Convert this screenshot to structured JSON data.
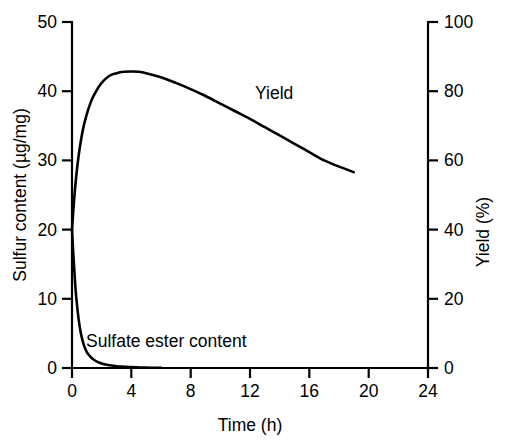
{
  "chart_data": {
    "type": "line",
    "title": "",
    "xlabel": "Time (h)",
    "ylabel": "Sulfur content (µg/mg)",
    "y2label": "Yield (%)",
    "xlim": [
      0,
      24
    ],
    "ylim": [
      0,
      50
    ],
    "y2lim": [
      0,
      100
    ],
    "xticks": [
      0,
      4,
      8,
      12,
      16,
      20,
      24
    ],
    "xticklabels": [
      "0",
      "4",
      "8",
      "12",
      "16",
      "20",
      "24"
    ],
    "yticks": [
      0,
      10,
      20,
      30,
      40,
      50
    ],
    "yticklabels": [
      "0",
      "10",
      "20",
      "30",
      "40",
      "50"
    ],
    "y2ticks": [
      0,
      20,
      40,
      60,
      80,
      100
    ],
    "y2ticklabels": [
      "0",
      "20",
      "40",
      "60",
      "80",
      "100"
    ],
    "grid": false,
    "legend": "inline-annotations",
    "series": [
      {
        "name": "Yield",
        "label": "Yield",
        "axis": "left",
        "color": "#000000",
        "x": [
          0.0,
          0.15,
          0.3,
          0.5,
          0.75,
          1.0,
          1.3,
          1.6,
          2.0,
          2.5,
          3.0,
          3.5,
          4.0,
          4.5,
          5.0,
          6.0,
          7.0,
          8.0,
          9.0,
          10.0,
          11.0,
          12.0,
          13.0,
          14.0,
          15.0,
          16.0,
          17.0,
          18.0,
          19.0
        ],
        "y": [
          20.0,
          24.5,
          28.0,
          31.5,
          34.6,
          36.7,
          38.6,
          39.9,
          41.2,
          42.2,
          42.6,
          42.8,
          42.85,
          42.8,
          42.6,
          42.0,
          41.2,
          40.3,
          39.3,
          38.2,
          37.1,
          36.0,
          34.8,
          33.6,
          32.4,
          31.2,
          30.0,
          29.1,
          28.3
        ],
        "y_percent": [
          40.0,
          49.0,
          56.0,
          63.0,
          69.2,
          73.4,
          77.2,
          79.8,
          82.4,
          84.4,
          85.2,
          85.6,
          85.7,
          85.6,
          85.2,
          84.0,
          82.4,
          80.6,
          78.6,
          76.4,
          74.2,
          72.0,
          69.6,
          67.2,
          64.8,
          62.4,
          60.0,
          58.2,
          56.6
        ]
      },
      {
        "name": "Sulfate ester content",
        "label": "Sulfate ester content",
        "axis": "left",
        "color": "#000000",
        "x": [
          0.0,
          0.1,
          0.2,
          0.3,
          0.45,
          0.6,
          0.8,
          1.0,
          1.25,
          1.5,
          1.75,
          2.0,
          2.25,
          2.5,
          3.0,
          3.5,
          4.0,
          5.0,
          6.0
        ],
        "y": [
          20.0,
          16.0,
          12.6,
          9.9,
          7.0,
          5.0,
          3.3,
          2.3,
          1.6,
          1.15,
          0.85,
          0.65,
          0.5,
          0.4,
          0.25,
          0.18,
          0.12,
          0.06,
          0.03
        ]
      }
    ],
    "annotations": [
      {
        "text": "Yield",
        "x": 12.0,
        "y": 39.0
      },
      {
        "text": "Sulfate ester content",
        "x": 1.6,
        "y": 4.4
      }
    ]
  }
}
